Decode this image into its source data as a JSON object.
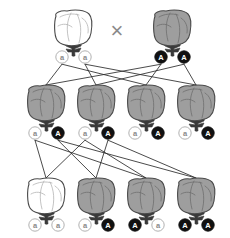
{
  "diagram": {
    "cross_symbol": "×",
    "colors": {
      "dominant_allele_fill": "#111111",
      "dominant_allele_text": "#ffffff",
      "recessive_allele_fill": "#ffffff",
      "recessive_allele_text": "#8a8a8a",
      "recessive_allele_stroke": "#a8a8a8",
      "phenotype_dominant_body": "#9e9e9e",
      "phenotype_recessive_body": "#ffffff",
      "outline": "#4a4a4a",
      "line": "#2b2b2b",
      "cross_mark": "#8a8a8a",
      "background": "#ffffff"
    },
    "generations": [
      {
        "name": "parental",
        "label": "P",
        "y_organism": 30,
        "y_alleles": 57,
        "individuals": [
          {
            "id": "parent-1",
            "x": 73,
            "phenotype": "recessive",
            "body_color": "#ffffff",
            "alleles": [
              {
                "symbol": "a",
                "type": "recessive",
                "x": 62
              },
              {
                "symbol": "a",
                "type": "recessive",
                "x": 85
              }
            ]
          },
          {
            "id": "parent-2",
            "x": 172,
            "phenotype": "dominant",
            "body_color": "#9e9e9e",
            "alleles": [
              {
                "symbol": "A",
                "type": "dominant",
                "x": 161
              },
              {
                "symbol": "A",
                "type": "dominant",
                "x": 184
              }
            ]
          }
        ]
      },
      {
        "name": "f1",
        "label": "F1",
        "y_organism": 105,
        "y_alleles": 133,
        "individuals": [
          {
            "id": "f1-1",
            "x": 46,
            "phenotype": "dominant",
            "body_color": "#9e9e9e",
            "alleles": [
              {
                "symbol": "a",
                "type": "recessive",
                "x": 35
              },
              {
                "symbol": "A",
                "type": "dominant",
                "x": 58
              }
            ]
          },
          {
            "id": "f1-2",
            "x": 96,
            "phenotype": "dominant",
            "body_color": "#9e9e9e",
            "alleles": [
              {
                "symbol": "a",
                "type": "recessive",
                "x": 85
              },
              {
                "symbol": "A",
                "type": "dominant",
                "x": 108
              }
            ]
          },
          {
            "id": "f1-3",
            "x": 146,
            "phenotype": "dominant",
            "body_color": "#9e9e9e",
            "alleles": [
              {
                "symbol": "a",
                "type": "recessive",
                "x": 135
              },
              {
                "symbol": "A",
                "type": "dominant",
                "x": 158
              }
            ]
          },
          {
            "id": "f1-4",
            "x": 196,
            "phenotype": "dominant",
            "body_color": "#9e9e9e",
            "alleles": [
              {
                "symbol": "a",
                "type": "recessive",
                "x": 185
              },
              {
                "symbol": "A",
                "type": "dominant",
                "x": 208
              }
            ]
          }
        ]
      },
      {
        "name": "f2",
        "label": "F2",
        "y_organism": 198,
        "y_alleles": 225,
        "individuals": [
          {
            "id": "f2-1",
            "x": 46,
            "phenotype": "recessive",
            "body_color": "#ffffff",
            "alleles": [
              {
                "symbol": "a",
                "type": "recessive",
                "x": 35
              },
              {
                "symbol": "a",
                "type": "recessive",
                "x": 58
              }
            ]
          },
          {
            "id": "f2-2",
            "x": 96,
            "phenotype": "dominant",
            "body_color": "#9e9e9e",
            "alleles": [
              {
                "symbol": "a",
                "type": "recessive",
                "x": 85
              },
              {
                "symbol": "A",
                "type": "dominant",
                "x": 108
              }
            ]
          },
          {
            "id": "f2-3",
            "x": 146,
            "phenotype": "dominant",
            "body_color": "#9e9e9e",
            "alleles": [
              {
                "symbol": "A",
                "type": "dominant",
                "x": 135
              },
              {
                "symbol": "a",
                "type": "recessive",
                "x": 158
              }
            ]
          },
          {
            "id": "f2-4",
            "x": 196,
            "phenotype": "dominant",
            "body_color": "#9e9e9e",
            "alleles": [
              {
                "symbol": "A",
                "type": "dominant",
                "x": 185
              },
              {
                "symbol": "A",
                "type": "dominant",
                "x": 208
              }
            ]
          }
        ]
      }
    ]
  }
}
